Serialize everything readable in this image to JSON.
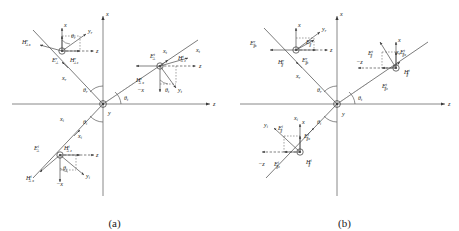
{
  "figure": {
    "panels": [
      {
        "id": "a",
        "caption": "(a)",
        "polarization": "perpendicular",
        "axes": {
          "vertical": "x",
          "horizontal": "z",
          "into_page": "y",
          "neg_x": "−x",
          "neg_z": "−z"
        },
        "angles": {
          "reflected": "θ",
          "reflected_sub": "r",
          "incident": "θ",
          "incident_sub": "i",
          "transmitted": "θ",
          "transmitted_sub": "t"
        },
        "rays": [
          {
            "name": "incident-ray-axis",
            "label": "x",
            "sub": "i"
          },
          {
            "name": "reflected-ray-axis",
            "label": "x",
            "sub": "r"
          },
          {
            "name": "transmitted-ray-axis",
            "label": "x",
            "sub": "t"
          }
        ],
        "clusters": [
          {
            "name": "reflected-wave-cluster",
            "fields": [
              {
                "sym": "E",
                "perp": "⊥",
                "sup": "r",
                "sub": ""
              },
              {
                "sym": "H",
                "perp": "⊥",
                "sup": "r",
                "sub": "x"
              },
              {
                "sym": "H",
                "perp": "⊥",
                "sup": "r",
                "sub": "z"
              }
            ],
            "local_axes": [
              "x",
              "y",
              "z"
            ],
            "local_axis_subs": [
              "",
              "r",
              ""
            ],
            "angle": "θ",
            "angle_sub": "r"
          },
          {
            "name": "transmitted-wave-cluster",
            "fields": [
              {
                "sym": "E",
                "perp": "⊥",
                "sup": "t",
                "sub": ""
              },
              {
                "sym": "H",
                "perp": "⊥",
                "sup": "t",
                "sub": "x"
              },
              {
                "sym": "H",
                "perp": "⊥",
                "sup": "t",
                "sub": "z"
              }
            ],
            "local_axes": [
              "x",
              "y",
              "z"
            ],
            "local_axis_subs": [
              "t",
              "t",
              ""
            ],
            "angle": "θ",
            "angle_sub": "t",
            "neg_axis": "−x"
          },
          {
            "name": "incident-wave-cluster",
            "fields": [
              {
                "sym": "E",
                "perp": "⊥",
                "sup": "i",
                "sub": ""
              },
              {
                "sym": "H",
                "perp": "⊥",
                "sup": "i",
                "sub": "x"
              },
              {
                "sym": "H",
                "perp": "⊥",
                "sup": "i",
                "sub": "z"
              }
            ],
            "local_axes": [
              "x",
              "y",
              "z"
            ],
            "local_axis_subs": [
              "i",
              "i",
              ""
            ],
            "angle": "θ",
            "angle_sub": "i",
            "neg_axis": "−x"
          }
        ]
      },
      {
        "id": "b",
        "caption": "(b)",
        "polarization": "parallel",
        "axes": {
          "vertical": "x",
          "horizontal": "z",
          "into_page": "y",
          "neg_x": "−x",
          "neg_z": "−z"
        },
        "angles": {
          "reflected": "θ",
          "reflected_sub": "r",
          "incident": "θ",
          "incident_sub": "i",
          "transmitted": "θ",
          "transmitted_sub": "t"
        },
        "rays": [
          {
            "name": "incident-ray-axis",
            "label": "x",
            "sub": "i"
          },
          {
            "name": "reflected-ray-axis",
            "label": "x",
            "sub": "r"
          },
          {
            "name": "transmitted-ray-axis",
            "label": "x",
            "sub": "t"
          }
        ],
        "clusters": [
          {
            "name": "reflected-wave-cluster",
            "fields": [
              {
                "sym": "E",
                "par": "∥",
                "sup": "r",
                "sub": "x"
              },
              {
                "sym": "E",
                "par": "∥",
                "sup": "r",
                "sub": ""
              },
              {
                "sym": "E",
                "par": "∥",
                "sup": "r",
                "sub": "z"
              },
              {
                "sym": "H",
                "par": "∥",
                "sup": "r",
                "sub": ""
              }
            ],
            "local_axes": [
              "x",
              "y",
              "z"
            ],
            "local_axis_subs": [
              "",
              "r",
              ""
            ]
          },
          {
            "name": "transmitted-wave-cluster",
            "fields": [
              {
                "sym": "E",
                "par": "∥",
                "sup": "t",
                "sub": ""
              },
              {
                "sym": "E",
                "par": "∥",
                "sup": "t",
                "sub": "x"
              },
              {
                "sym": "E",
                "par": "∥",
                "sup": "t",
                "sub": "z"
              },
              {
                "sym": "H",
                "par": "∥",
                "sup": "t",
                "sub": ""
              }
            ],
            "local_axes": [
              "x",
              "z"
            ],
            "local_axis_subs": [
              "",
              ""
            ],
            "neg_axis": "−z"
          },
          {
            "name": "incident-wave-cluster",
            "fields": [
              {
                "sym": "E",
                "par": "∥",
                "sup": "i",
                "sub": ""
              },
              {
                "sym": "E",
                "par": "∥",
                "sup": "i",
                "sub": "x"
              },
              {
                "sym": "E",
                "par": "∥",
                "sup": "i",
                "sub": "z"
              },
              {
                "sym": "H",
                "par": "∥",
                "sup": "i",
                "sub": ""
              }
            ],
            "local_axes": [
              "x",
              "y"
            ],
            "local_axis_subs": [
              "",
              "i"
            ],
            "neg_axis": "−z"
          }
        ]
      }
    ],
    "colors": {
      "line": "#4a4a4a",
      "text": "#1a1a1a",
      "background": "#ffffff"
    }
  }
}
